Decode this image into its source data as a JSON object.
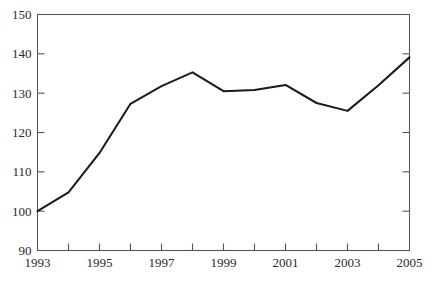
{
  "chart_data": {
    "type": "line",
    "title": "",
    "subtitle": "",
    "xlabel": "",
    "ylabel": "",
    "x": [
      1993,
      1994,
      1995,
      1996,
      1997,
      1998,
      1999,
      2000,
      2001,
      2002,
      2003,
      2004,
      2005
    ],
    "values": [
      100.0,
      104.8,
      114.8,
      127.3,
      131.8,
      135.3,
      130.5,
      130.8,
      132.1,
      127.5,
      125.5,
      132.0,
      139.1
    ],
    "series": [
      {
        "name": "index",
        "values": [
          100.0,
          104.8,
          114.8,
          127.3,
          131.8,
          135.3,
          130.5,
          130.8,
          132.1,
          127.5,
          125.5,
          132.0,
          139.1
        ]
      }
    ],
    "xlim": [
      1993,
      2005
    ],
    "ylim": [
      90,
      150
    ],
    "y_ticks": [
      90,
      100,
      110,
      120,
      130,
      140,
      150
    ],
    "y_tick_labels": [
      "90",
      "100",
      "110",
      "120",
      "130",
      "140",
      "150"
    ],
    "x_ticks": [
      1993,
      1994,
      1995,
      1996,
      1997,
      1998,
      1999,
      2000,
      2001,
      2002,
      2003,
      2004,
      2005
    ],
    "x_tick_labels": [
      "1993",
      "",
      "1995",
      "",
      "1997",
      "",
      "1999",
      "",
      "2001",
      "",
      "2003",
      "",
      "2005"
    ],
    "x_labeled_ticks": [
      "1993",
      "1995",
      "1997",
      "1999",
      "2001",
      "2003",
      "2005"
    ],
    "grid": false,
    "legend": null,
    "legend_position": "none",
    "line_color": "#1b1b1b",
    "axis_color": "#55565a",
    "background_color": "#ffffff",
    "right_axis_ticks": true,
    "annotations": []
  }
}
